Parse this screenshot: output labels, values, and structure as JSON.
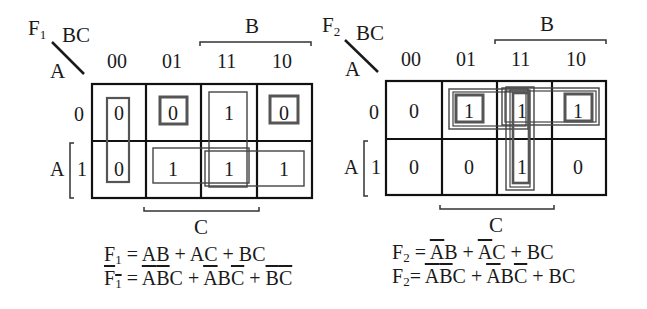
{
  "maps": [
    {
      "name": "F1",
      "func_label": "F",
      "func_sub": "1",
      "row_var": "A",
      "col_vars": "BC",
      "col_headers": [
        "00",
        "01",
        "11",
        "10"
      ],
      "row_headers": [
        "0",
        "1"
      ],
      "cells": [
        [
          "0",
          "0",
          "1",
          "0"
        ],
        [
          "0",
          "1",
          "1",
          "1"
        ]
      ],
      "b_label": "B",
      "c_label": "C",
      "a_label": "A",
      "groups": [
        {
          "type": "zero",
          "cells": "A'B'C' + AB'C' (column 00)"
        },
        {
          "type": "zero",
          "cells": "A'B'C (0,01)"
        },
        {
          "type": "zero",
          "cells": "A'BC' (0,10)"
        },
        {
          "type": "one",
          "cells": "BC (column 11)"
        },
        {
          "type": "one",
          "cells": "AC (row 1, 01-11)"
        },
        {
          "type": "one",
          "cells": "AB (row 1, 11-10)"
        }
      ],
      "equations": [
        {
          "lhs": "F1",
          "lhs_bar": false,
          "rhs": "AB + AC + BC"
        },
        {
          "lhs": "F1",
          "lhs_bar": true,
          "rhs": "A'B'C + A'BC' + B'C'"
        }
      ]
    },
    {
      "name": "F2",
      "func_label": "F",
      "func_sub": "2",
      "row_var": "A",
      "col_vars": "BC",
      "col_headers": [
        "00",
        "01",
        "11",
        "10"
      ],
      "row_headers": [
        "0",
        "1"
      ],
      "cells": [
        [
          "0",
          "1",
          "1",
          "1"
        ],
        [
          "0",
          "0",
          "1",
          "0"
        ]
      ],
      "b_label": "B",
      "c_label": "C",
      "a_label": "A",
      "groups": [
        {
          "type": "one",
          "cells": "A'C (row 0, 01-11)"
        },
        {
          "type": "one",
          "cells": "A'B (row 0, 11-10)"
        },
        {
          "type": "one",
          "cells": "BC (column 11)"
        },
        {
          "type": "one-min",
          "cells": "A'B'C (0,01)"
        },
        {
          "type": "one-min",
          "cells": "A'BC' (0,10)"
        }
      ],
      "equations": [
        {
          "lhs": "F2",
          "lhs_bar": false,
          "rhs": "A'B + A'C + BC"
        },
        {
          "lhs": "F2",
          "lhs_bar": false,
          "rhs": "A'B'C + A'BC' + BC"
        }
      ]
    }
  ]
}
